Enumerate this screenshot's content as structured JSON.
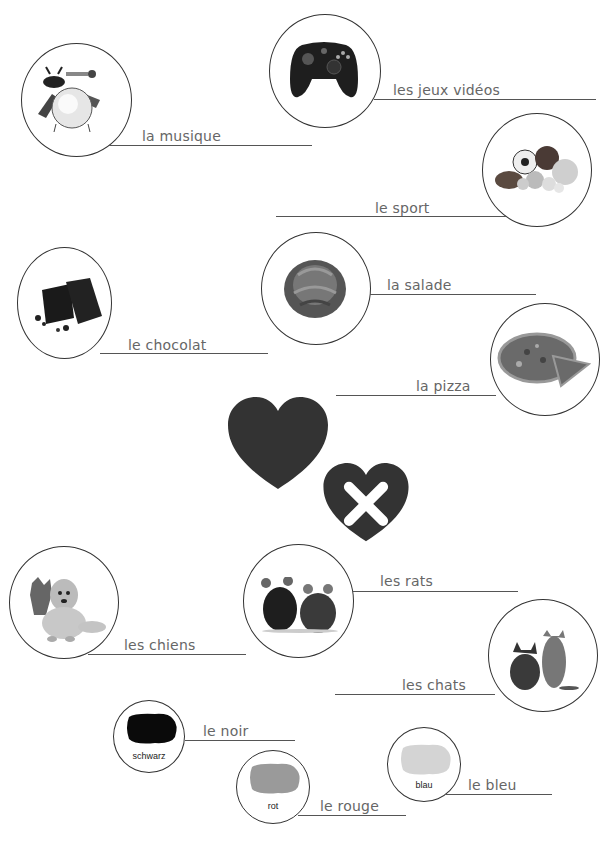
{
  "worksheet": {
    "items": [
      {
        "id": "musique",
        "word": "la musique",
        "icon": "music-instruments-icon"
      },
      {
        "id": "jeux",
        "word": "les jeux vidéos",
        "icon": "game-controller-icon"
      },
      {
        "id": "sport",
        "word": "le sport",
        "icon": "sports-balls-icon"
      },
      {
        "id": "chocolat",
        "word": "le chocolat",
        "icon": "chocolate-icon"
      },
      {
        "id": "salade",
        "word": "la salade",
        "icon": "lettuce-icon"
      },
      {
        "id": "pizza",
        "word": "la pizza",
        "icon": "pizza-icon"
      },
      {
        "id": "chiens",
        "word": "les chiens",
        "icon": "dogs-icon"
      },
      {
        "id": "rats",
        "word": "les rats",
        "icon": "rats-icon"
      },
      {
        "id": "chats",
        "word": "les chats",
        "icon": "cats-icon"
      }
    ],
    "colors": [
      {
        "id": "noir",
        "word": "le noir",
        "label": "schwarz",
        "swatch": "#0a0a0a"
      },
      {
        "id": "rouge",
        "word": "le rouge",
        "label": "rot",
        "swatch": "#9a9a9a"
      },
      {
        "id": "bleu",
        "word": "le bleu",
        "label": "blau",
        "swatch": "#d4d4d4"
      }
    ],
    "legend": {
      "like": "heart-icon",
      "dislike": "heart-crossed-icon",
      "heart_color": "#333333"
    }
  }
}
